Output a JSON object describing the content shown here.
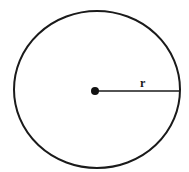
{
  "diagram": {
    "shape": "circle",
    "center": {
      "x": 95,
      "y": 90
    },
    "radius_x": 83,
    "radius_y": 79,
    "stroke_color": "#1a1a1a",
    "radius_label": "r",
    "radius_line": {
      "x1": 95,
      "y1": 90,
      "x2": 180,
      "y2": 90
    }
  }
}
